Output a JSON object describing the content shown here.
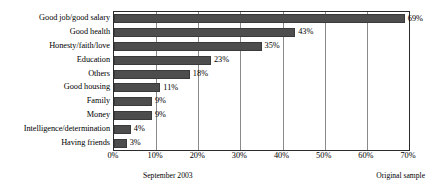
{
  "chart_data": {
    "type": "bar",
    "orientation": "horizontal",
    "title": "",
    "xlabel": "",
    "ylabel": "",
    "xlim": [
      0,
      70
    ],
    "grid": true,
    "legend": false,
    "categories": [
      "Good job/good salary",
      "Good health",
      "Honesty/faith/love",
      "Education",
      "Others",
      "Good housing",
      "Family",
      "Money",
      "Intelligence/determination",
      "Having friends"
    ],
    "values": [
      69,
      43,
      35,
      23,
      18,
      11,
      9,
      9,
      4,
      3
    ],
    "data_labels": [
      "69%",
      "43%",
      "35%",
      "23%",
      "18%",
      "11%",
      "9%",
      "9%",
      "4%",
      "3%"
    ],
    "xticks": [
      0,
      10,
      20,
      30,
      40,
      50,
      60,
      70
    ],
    "xtick_labels": [
      "0%",
      "10%",
      "20%",
      "30%",
      "40%",
      "50%",
      "60%",
      "70%"
    ],
    "bar_color": "#4d4d4d",
    "gridline_color": "#8a8a8a",
    "axis_color": "#2b2b2b"
  },
  "footer": {
    "left_note": "September 2003",
    "right_note": "Original sample"
  }
}
